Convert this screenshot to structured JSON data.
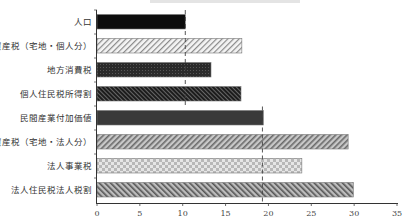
{
  "chart_data": {
    "type": "bar",
    "orientation": "horizontal",
    "title": "",
    "xlabel": "",
    "ylabel": "",
    "categories": [
      "人口",
      "固定資産税（宅地・個人分）",
      "地方消費税",
      "個人住民税所得割",
      "民間産業付加価値",
      "固定資産税（宅地・法人分）",
      "法人事業税",
      "法人住民税法人税割"
    ],
    "values": [
      10.3,
      16.9,
      13.3,
      16.8,
      19.4,
      29.3,
      23.9,
      29.9
    ],
    "patterns": [
      "solid-black",
      "light-hatch",
      "dark-dots",
      "dark-hatch-back",
      "solid-darkgray",
      "gray-hatch",
      "light-check",
      "gray-hatch-back"
    ],
    "reference_lines": [
      {
        "value": 10.3,
        "style": "dashed",
        "span_categories": [
          0,
          3
        ]
      },
      {
        "value": 19.3,
        "style": "dashed",
        "span_categories": [
          4,
          7
        ]
      }
    ],
    "xlim": [
      0,
      35
    ],
    "xticks": [
      0,
      5,
      10,
      15,
      20,
      25,
      30,
      35
    ],
    "grid": false,
    "legend": null
  }
}
